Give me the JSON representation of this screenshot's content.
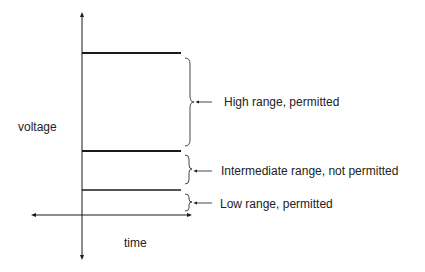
{
  "axes": {
    "y_label": "voltage",
    "x_label": "time"
  },
  "ranges": [
    {
      "name": "high",
      "label": "High range, permitted"
    },
    {
      "name": "intermediate",
      "label": "Intermediate range, not permitted"
    },
    {
      "name": "low",
      "label": "Low range, permitted"
    }
  ],
  "colors": {
    "line": "#1a1a1a",
    "text": "#222222"
  }
}
